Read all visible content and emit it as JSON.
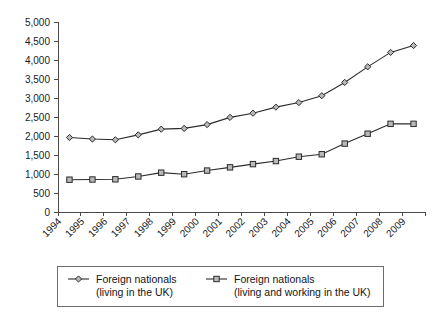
{
  "chart_data": {
    "type": "line",
    "title": "",
    "subtitle": "",
    "xlabel": "",
    "ylabel": "",
    "grid": false,
    "legend_position": "bottom",
    "x": [
      1994,
      1995,
      1996,
      1997,
      1998,
      1999,
      2000,
      2001,
      2002,
      2003,
      2004,
      2005,
      2006,
      2007,
      2008,
      2009
    ],
    "categories": [
      "1994",
      "1995",
      "1996",
      "1997",
      "1998",
      "1999",
      "2000",
      "2001",
      "2002",
      "2003",
      "2004",
      "2005",
      "2006",
      "2007",
      "2008",
      "2009"
    ],
    "xlim": [
      1994,
      2010
    ],
    "ylim": [
      0,
      5000
    ],
    "ytick_values": [
      0,
      500,
      1000,
      1500,
      2000,
      2500,
      3000,
      3500,
      4000,
      4500,
      5000
    ],
    "ytick_labels": [
      "0",
      "500",
      "1,000",
      "1,500",
      "2,000",
      "2,500",
      "3,000",
      "3,500",
      "4,000",
      "4,500",
      "5,000"
    ],
    "series": [
      {
        "name": "Foreign nationals (living in the UK)",
        "marker": "diamond",
        "values": [
          1960,
          1920,
          1900,
          2030,
          2180,
          2200,
          2300,
          2490,
          2600,
          2760,
          2880,
          3060,
          3410,
          3820,
          4200,
          4380
        ]
      },
      {
        "name": "Foreign nationals (living and working in the UK)",
        "marker": "square",
        "values": [
          850,
          855,
          860,
          935,
          1035,
          995,
          1090,
          1175,
          1260,
          1340,
          1455,
          1520,
          1800,
          2060,
          2320,
          2320
        ]
      }
    ]
  },
  "legend": {
    "entries": [
      {
        "marker": "diamond",
        "line1": "Foreign nationals",
        "line2": "(living in the UK)"
      },
      {
        "marker": "square",
        "line1": "Foreign nationals",
        "line2": "(living and working in the UK)"
      }
    ]
  },
  "colors": {
    "axis": "#4a4a4a",
    "line": "#2b2b2b",
    "marker_fill": "#b9b9b9",
    "text": "#141414",
    "background": "#ffffff"
  }
}
